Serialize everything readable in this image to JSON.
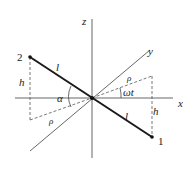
{
  "diagram": {
    "axes": {
      "x_label": "x",
      "y_label": "y",
      "z_label": "z"
    },
    "points": {
      "p1_label": "1",
      "p2_label": "2"
    },
    "labels": {
      "rod_upper": "l",
      "rod_lower": "l",
      "height_left": "h",
      "height_right": "h",
      "angle_alpha": "α",
      "angle_omega_t": "ωt",
      "rho_right": "ρ",
      "rho_left": "ρ"
    },
    "colors": {
      "axis": "#555555",
      "rod": "#1a1a1a",
      "dashed": "#555555"
    }
  }
}
